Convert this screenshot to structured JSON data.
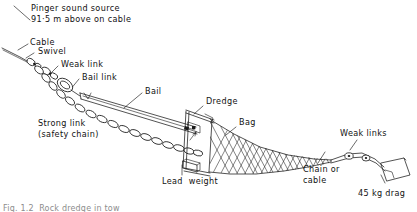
{
  "figure": {
    "background_color": "#ffffff",
    "ink_color": "#1a1a1a",
    "width": 417,
    "height": 212
  },
  "labels": {
    "pinger_line1": "Pinger sound source",
    "pinger_line2": "91·5 m above on cable",
    "cable": "Cable",
    "swivel": "Swivel",
    "weak_link": "Weak link",
    "bail_link": "Bail link",
    "bail": "Bail",
    "strong_link_line1": "Strong link",
    "strong_link_line2": "(safety chain)",
    "dredge": "Dredge",
    "bag": "Bag",
    "lead_weight": "Lead  weight",
    "chain_or_cable_line1": "Chain or",
    "chain_or_cable_line2": "cable",
    "weak_links": "Weak links",
    "drag_weight": "45 kg drag"
  },
  "caption": {
    "text": "Fig. 1.2  Rock dredge in tow"
  },
  "icons": {
    "pinger_pointer": "pointer-line-icon",
    "cable_leader": "leader-line-icon",
    "swivel_leader": "leader-line-icon",
    "weak_link_leader": "leader-line-icon",
    "bail_link_leader": "leader-line-icon",
    "bail_leader": "leader-line-icon",
    "dredge_leader": "leader-line-icon",
    "bag_leader": "leader-line-icon",
    "lead_weight_leader": "leader-line-icon",
    "chain_cable_leader": "leader-line-icon",
    "weak_links_leader": "leader-line-icon",
    "drag_leader": "leader-line-icon"
  }
}
